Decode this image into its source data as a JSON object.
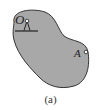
{
  "figure": {
    "caption": "(a)",
    "body_fill": "#a9a9a9",
    "body_stroke": "#333333",
    "points": [
      {
        "label": "O",
        "role": "pin-support"
      },
      {
        "label": "A",
        "role": "point-on-body"
      }
    ]
  },
  "labels": {
    "pivot": "O",
    "point": "A"
  }
}
